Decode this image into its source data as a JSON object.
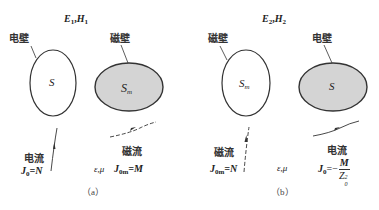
{
  "panel_a": {
    "field_label": "E",
    "field_label_sub": "1",
    "field_sep": ",",
    "field_label2": "H",
    "field_label2_sub": "1",
    "left_wall_label": "电壁",
    "left_surface_label": "S",
    "right_wall_label": "磁壁",
    "right_surface_label": "S",
    "right_surface_sub": "m",
    "source1_name": "电流",
    "source1_sym": "J",
    "source1_sub": "0",
    "source1_eq": "=N",
    "medium": "ε,μ",
    "source2_name": "磁流",
    "source2_sym": "J",
    "source2_sub": "0m",
    "source2_eq": "=M",
    "caption": "（a）"
  },
  "panel_b": {
    "field_label": "E",
    "field_label_sub": "2",
    "field_sep": ",",
    "field_label2": "H",
    "field_label2_sub": "2",
    "left_wall_label": "磁壁",
    "left_surface_label": "S",
    "left_surface_sub": "m",
    "right_wall_label": "电壁",
    "right_surface_label": "S",
    "source1_name": "磁流",
    "source1_sym": "J",
    "source1_sub": "0m",
    "source1_eq": "=N",
    "medium": "ε,μ",
    "source2_name": "电流",
    "source2_sym": "J",
    "source2_sub": "0",
    "source2_eq": "=−",
    "source2_frac_num": "M",
    "source2_frac_den": "Z",
    "source2_frac_den_sup": "2",
    "source2_frac_den_sub": "0",
    "caption": "（b）"
  },
  "colors": {
    "outline": "#333333",
    "gray_fill": "#d4d4d4",
    "white_fill": "#ffffff"
  }
}
